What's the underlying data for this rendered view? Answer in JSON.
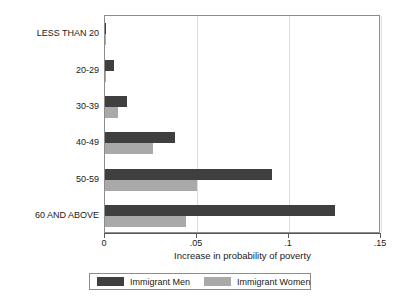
{
  "chart_data": {
    "type": "bar",
    "orientation": "horizontal",
    "title": "",
    "xlabel": "Increase in probability of poverty",
    "ylabel": "",
    "xlim": [
      0,
      0.15
    ],
    "xticks": [
      0,
      0.05,
      0.1,
      0.15
    ],
    "xticklabels": [
      "0",
      ".05",
      ".1",
      ".15"
    ],
    "grid": true,
    "legend_position": "bottom",
    "categories": [
      "LESS THAN 20",
      "20-29",
      "30-39",
      "40-49",
      "50-59",
      "60 AND ABOVE"
    ],
    "series": [
      {
        "name": "Immigrant Men",
        "color": "#3f3f3f",
        "values": [
          0.0005,
          0.005,
          0.012,
          0.038,
          0.091,
          0.125
        ]
      },
      {
        "name": "Immigrant Women",
        "color": "#a9a9a9",
        "values": [
          0.0,
          0.0003,
          0.007,
          0.026,
          0.05,
          0.044
        ]
      }
    ]
  },
  "legend": {
    "entries": [
      {
        "label": "Immigrant Men"
      },
      {
        "label": "Immigrant Women"
      }
    ]
  }
}
